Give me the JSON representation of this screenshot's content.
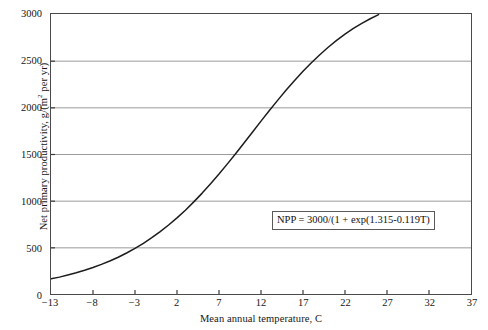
{
  "chart_data": {
    "type": "line",
    "title": "",
    "xlabel": "Mean annual temperature, C",
    "ylabel": "Net primary productivity, g/(m² per yr)",
    "ylabel_prefix": "Net primary productivity, g/(m",
    "ylabel_sup": "2",
    "ylabel_suffix": " per yr)",
    "xlim": [
      -13,
      37
    ],
    "ylim": [
      0,
      3000
    ],
    "xticks": [
      -13,
      -8,
      -3,
      2,
      7,
      12,
      17,
      22,
      27,
      32,
      37
    ],
    "xticklabels": [
      "−13",
      "−8",
      "−3",
      "2",
      "7",
      "12",
      "17",
      "22",
      "27",
      "32",
      "37"
    ],
    "yticks": [
      0,
      500,
      1000,
      1500,
      2000,
      2500,
      3000
    ],
    "yticklabels": [
      "0",
      "500",
      "1000",
      "1500",
      "2000",
      "2500",
      "3000"
    ],
    "grid": "horizontal",
    "grid_color": "#9a9a9a",
    "legend": "none",
    "line_color": "#1c1c1c",
    "line_width": 1.5,
    "annotations": [
      {
        "name": "equation-box",
        "text": "NPP = 3000/(1 + exp(1.315-0.119T)",
        "x": 17.7,
        "y": 830
      }
    ],
    "series": [
      {
        "name": "NPP logistic curve",
        "formula": "NPP = 3000/(1 + exp(1.315 - 0.119*T))",
        "x": [
          -13,
          -12,
          -11,
          -10,
          -9,
          -8,
          -7,
          -6,
          -5,
          -4,
          -3,
          -2,
          -1,
          0,
          1,
          2,
          3,
          4,
          5,
          6,
          7,
          8,
          9,
          10,
          11,
          12,
          13,
          14,
          15,
          16,
          17,
          18,
          19,
          20,
          21,
          22,
          23,
          24,
          25,
          26,
          27,
          28,
          29,
          30
        ],
        "values": [
          162,
          181,
          203,
          227,
          254,
          284,
          317,
          354,
          394,
          439,
          489,
          543,
          603,
          668,
          739,
          816,
          898,
          987,
          1081,
          1181,
          1285,
          1394,
          1506,
          1621,
          1736,
          1852,
          1966,
          2077,
          2185,
          2288,
          2386,
          2478,
          2564,
          2644,
          2717,
          2784,
          2845,
          2900,
          2949,
          2993,
          3033,
          3068,
          3099,
          3127
        ]
      }
    ]
  }
}
